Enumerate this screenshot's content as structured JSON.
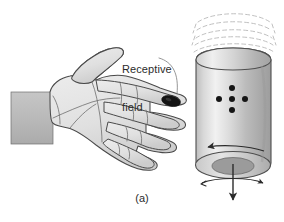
{
  "figure": {
    "caption": "(a)",
    "annotations": {
      "receptive_field_line1": "Receptive",
      "receptive_field_line2": "field"
    },
    "colors": {
      "background": "#ffffff",
      "ink": "#2b2b2b",
      "outline": "#3a3a3a",
      "skin_fill": "#e3e3e3",
      "skin_shadow": "#cfcfcf",
      "sleeve_fill": "#bdbdbd",
      "cylinder_light": "#f2f2f2",
      "cylinder_mid": "#c9c9c9",
      "cylinder_dark": "#a8a8a8",
      "cylinder_base": "#d6d6d6",
      "cylinder_base_inner": "#9a9a9a",
      "receptive_field_dot": "#151515",
      "motion_arc": "#b3b3b3"
    },
    "parts": {
      "hand_name": "hand-palm-down",
      "sleeve_name": "forearm-sleeve",
      "cylinder_name": "rotating-drum",
      "receptive_field_name": "receptive-field-spot",
      "dot_pattern_name": "braille-dot-pattern",
      "motion_arcs_name": "rotation-motion-arcs",
      "rotation_arrow_name": "rotation-direction-arrow",
      "down_arrow_name": "translation-down-arrow",
      "spin_arrow_name": "spin-double-arrow"
    },
    "dot_pattern": {
      "shape": "plus",
      "count": 5,
      "points": [
        {
          "x": 232,
          "y": 88
        },
        {
          "x": 232,
          "y": 99
        },
        {
          "x": 232,
          "y": 110
        },
        {
          "x": 220,
          "y": 99
        },
        {
          "x": 244,
          "y": 99
        }
      ]
    },
    "motion_arcs": {
      "count": 5
    }
  }
}
